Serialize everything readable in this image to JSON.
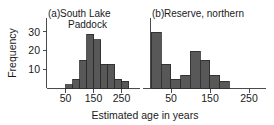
{
  "figure": {
    "ylabel": "Frequency",
    "xlabel": "Estimated age in years",
    "bar_color": "#585858",
    "axis_color": "#4a4a4a"
  },
  "panels": [
    {
      "tag": "(a)",
      "title_line1": "South Lake",
      "title_line2": "Paddock",
      "title_full": "(a) South Lake Paddock"
    },
    {
      "tag": "(b)",
      "title_line1": "Reserve, northern",
      "title_line2": "",
      "title_full": "(b) Reserve, northern"
    }
  ],
  "axes": {
    "y_ticks": [
      10,
      20,
      30
    ],
    "y_tick_labels": [
      "10",
      "20",
      "30"
    ],
    "y_min": 0,
    "y_max": 34,
    "x_ticks": [
      50,
      150,
      250
    ],
    "x_tick_labels": [
      "50",
      "150",
      "250"
    ],
    "x_min": 0,
    "x_max": 290
  },
  "chart_data": {
    "type": "bar",
    "title": "",
    "xlabel": "Estimated age in years",
    "ylabel": "Frequency",
    "xlim": [
      0,
      290
    ],
    "ylim": [
      0,
      34
    ],
    "grid": false,
    "legend": "none",
    "panels": [
      {
        "name": "(a) South Lake Paddock",
        "bin_width": 25,
        "bin_edges": [
          50,
          75,
          100,
          125,
          150,
          175,
          200,
          225,
          250,
          275
        ],
        "bin_centers": [
          62.5,
          87.5,
          112.5,
          137.5,
          162.5,
          187.5,
          212.5,
          237.5,
          262.5
        ],
        "values": [
          2,
          5,
          15,
          29,
          26,
          13,
          13,
          5,
          4
        ]
      },
      {
        "name": "(b) Reserve, northern",
        "bin_width": 25,
        "bin_edges": [
          25,
          50,
          75,
          100,
          125,
          150,
          175,
          200,
          225
        ],
        "bin_centers": [
          37.5,
          62.5,
          87.5,
          112.5,
          137.5,
          162.5,
          187.5,
          212.5
        ],
        "values": [
          30,
          13,
          5,
          7,
          20,
          15,
          7,
          4
        ]
      }
    ]
  }
}
